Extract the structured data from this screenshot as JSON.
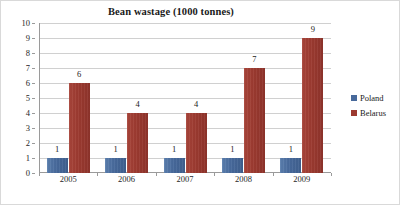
{
  "chart_data": {
    "type": "bar",
    "title": "Bean wastage (1000 tonnes)",
    "xlabel": "",
    "ylabel": "",
    "categories": [
      "2005",
      "2006",
      "2007",
      "2008",
      "2009"
    ],
    "series": [
      {
        "name": "Poland",
        "color": "#47699b",
        "values": [
          1,
          1,
          1,
          1,
          1
        ]
      },
      {
        "name": "Belarus",
        "color": "#9c3a30",
        "values": [
          6,
          4,
          4,
          7,
          9
        ]
      }
    ],
    "ylim": [
      0,
      10
    ],
    "y_ticks": [
      0,
      1,
      2,
      3,
      4,
      5,
      6,
      7,
      8,
      9,
      10
    ],
    "y_tick_labels": [
      "0",
      "1",
      "2",
      "3",
      "4",
      "5",
      "6",
      "7",
      "8",
      "9",
      "10"
    ],
    "grid": true,
    "legend_position": "right",
    "data_labels": true
  },
  "legend": {
    "items": [
      {
        "label": "Poland",
        "marker": "square-swatch-blue"
      },
      {
        "label": "Belarus",
        "marker": "square-swatch-red"
      }
    ]
  }
}
